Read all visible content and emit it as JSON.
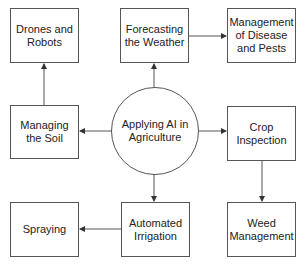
{
  "diagram": {
    "center": {
      "label": "Applying AI in Agriculture"
    },
    "nodes": [
      {
        "id": "drones",
        "label": "Drones and Robots"
      },
      {
        "id": "weather",
        "label": "Forecasting the Weather"
      },
      {
        "id": "disease",
        "label": "Management of Disease and Pests"
      },
      {
        "id": "soil",
        "label": "Managing the Soil"
      },
      {
        "id": "crop",
        "label": "Crop Inspection"
      },
      {
        "id": "spraying",
        "label": "Spraying"
      },
      {
        "id": "irrigation",
        "label": "Automated Irrigation"
      },
      {
        "id": "weed",
        "label": "Weed Management"
      }
    ],
    "edges": [
      {
        "from": "center",
        "to": "weather"
      },
      {
        "from": "center",
        "to": "soil"
      },
      {
        "from": "center",
        "to": "crop"
      },
      {
        "from": "center",
        "to": "irrigation"
      },
      {
        "from": "soil",
        "to": "drones"
      },
      {
        "from": "weather",
        "to": "disease"
      },
      {
        "from": "crop",
        "to": "weed"
      },
      {
        "from": "irrigation",
        "to": "spraying"
      }
    ],
    "colors": {
      "line": "#555555",
      "text": "#222222",
      "background": "#ffffff"
    }
  }
}
